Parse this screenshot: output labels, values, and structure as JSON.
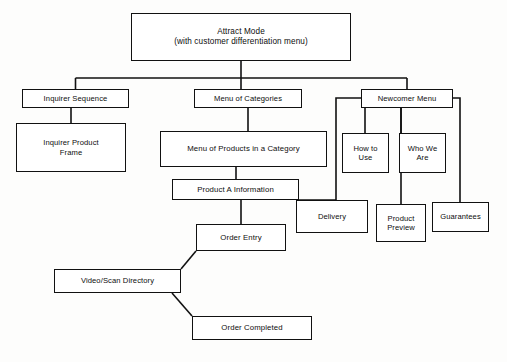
{
  "diagram": {
    "type": "tree-flowchart",
    "colors": {
      "background": "#fdfdfc",
      "box_fill": "#ffffff",
      "line": "#111111",
      "text": "#0d0d0d"
    },
    "nodes": {
      "attract_mode": "Attract Mode\n(with customer differentiation menu)",
      "inquirer_sequence": "Inquirer Sequence",
      "inquirer_product_frame": "Inquirer Product\nFrame",
      "menu_of_categories": "Menu of Categories",
      "menu_of_products": "Menu of Products in a Category",
      "product_a_information": "Product A Information",
      "newcomer_menu": "Newcomer Menu",
      "how_to_use": "How to\nUse",
      "who_we_are": "Who We\nAre",
      "delivery": "Delivery",
      "product_preview": "Product\nPreview",
      "guarantees": "Guarantees",
      "order_entry": "Order Entry",
      "video_scan_directory": "Video/Scan Directory",
      "order_completed": "Order Completed"
    },
    "edges": [
      {
        "from": "attract_mode",
        "to": "inquirer_sequence",
        "style": "orthogonal"
      },
      {
        "from": "attract_mode",
        "to": "menu_of_categories",
        "style": "orthogonal"
      },
      {
        "from": "attract_mode",
        "to": "newcomer_menu",
        "style": "orthogonal"
      },
      {
        "from": "inquirer_sequence",
        "to": "inquirer_product_frame",
        "style": "straight"
      },
      {
        "from": "menu_of_categories",
        "to": "menu_of_products",
        "style": "straight"
      },
      {
        "from": "menu_of_products",
        "to": "product_a_information",
        "style": "straight"
      },
      {
        "from": "product_a_information",
        "to": "order_entry",
        "style": "straight"
      },
      {
        "from": "newcomer_menu",
        "to": "how_to_use",
        "style": "orthogonal"
      },
      {
        "from": "newcomer_menu",
        "to": "who_we_are",
        "style": "straight"
      },
      {
        "from": "newcomer_menu",
        "to": "delivery",
        "style": "orthogonal"
      },
      {
        "from": "newcomer_menu",
        "to": "product_preview",
        "style": "straight"
      },
      {
        "from": "newcomer_menu",
        "to": "guarantees",
        "style": "orthogonal"
      },
      {
        "from": "order_entry",
        "to": "video_scan_directory",
        "style": "diagonal"
      },
      {
        "from": "video_scan_directory",
        "to": "order_completed",
        "style": "diagonal"
      }
    ]
  }
}
